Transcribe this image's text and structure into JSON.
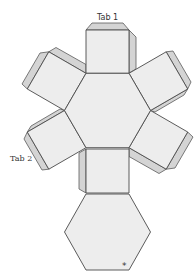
{
  "diagram": {
    "type": "hexagonal prism net",
    "labels": {
      "tab1": "Tab 1",
      "tab2": "Tab 2",
      "marker": "*"
    },
    "colors": {
      "background": "#ffffff",
      "face_fill": "#ededed",
      "tab_fill": "#d4d4d4",
      "stroke": "#4a4a4a"
    },
    "faces": [
      {
        "name": "center-hexagon"
      },
      {
        "name": "bottom-hexagon"
      },
      {
        "name": "top-square"
      },
      {
        "name": "upper-left-square"
      },
      {
        "name": "upper-right-square"
      },
      {
        "name": "lower-left-square"
      },
      {
        "name": "lower-right-square"
      },
      {
        "name": "bottom-square"
      }
    ]
  }
}
